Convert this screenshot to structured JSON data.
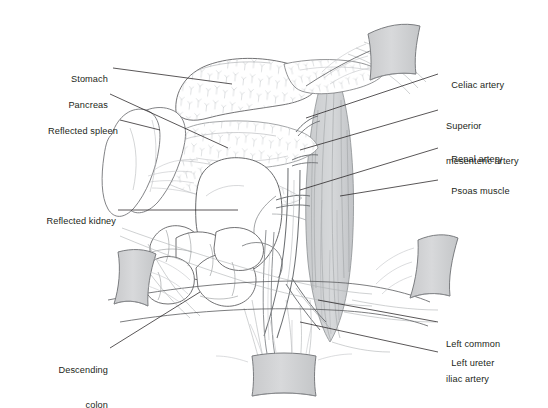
{
  "figure": {
    "background_color": "#ffffff",
    "ink_color": "#231f20",
    "line_color": "#4a4a4a",
    "pale_line_color": "#b9bdc0",
    "retractor_fill": "#d2d3d5",
    "retractor_stroke": "#6e7174",
    "muscle_fill": "#d0d2d4",
    "muscle_stroke": "#8a8d90"
  },
  "labels": {
    "left": [
      {
        "id": "stomach",
        "text": "Stomach",
        "lines": [
          "Stomach"
        ]
      },
      {
        "id": "pancreas",
        "text": "Pancreas",
        "lines": [
          "Pancreas"
        ]
      },
      {
        "id": "reflected-spleen",
        "text": "Reflected spleen",
        "lines": [
          "Reflected spleen"
        ]
      },
      {
        "id": "reflected-kidney",
        "text": "Reflected kidney",
        "lines": [
          "Reflected kidney"
        ]
      },
      {
        "id": "descending-colon",
        "text": "Descending colon",
        "lines": [
          "Descending",
          "colon"
        ]
      }
    ],
    "right": [
      {
        "id": "celiac-artery",
        "text": "Celiac artery",
        "lines": [
          "Celiac artery"
        ]
      },
      {
        "id": "superior-mesenteric-artery",
        "text": "Superior mesenteric artery",
        "lines": [
          "Superior",
          "mesenteric artery"
        ]
      },
      {
        "id": "renal-artery",
        "text": "Renal artery",
        "lines": [
          "Renal artery"
        ]
      },
      {
        "id": "psoas-muscle",
        "text": "Psoas muscle",
        "lines": [
          "Psoas muscle"
        ]
      },
      {
        "id": "left-common-iliac-artery",
        "text": "Left common iliac artery",
        "lines": [
          "Left common",
          "iliac artery"
        ]
      },
      {
        "id": "left-ureter",
        "text": "Left ureter",
        "lines": [
          "Left ureter"
        ]
      }
    ]
  },
  "structures": [
    {
      "id": "stomach",
      "name": "Stomach",
      "kind": "organ"
    },
    {
      "id": "pancreas",
      "name": "Pancreas",
      "kind": "organ"
    },
    {
      "id": "reflected-spleen",
      "name": "Reflected spleen",
      "kind": "organ"
    },
    {
      "id": "reflected-kidney",
      "name": "Reflected kidney",
      "kind": "organ"
    },
    {
      "id": "descending-colon",
      "name": "Descending colon",
      "kind": "organ"
    },
    {
      "id": "celiac-artery",
      "name": "Celiac artery",
      "kind": "vessel"
    },
    {
      "id": "superior-mesenteric-artery",
      "name": "Superior mesenteric artery",
      "kind": "vessel"
    },
    {
      "id": "renal-artery",
      "name": "Renal artery",
      "kind": "vessel"
    },
    {
      "id": "left-common-iliac-artery",
      "name": "Left common iliac artery",
      "kind": "vessel"
    },
    {
      "id": "left-ureter",
      "name": "Left ureter",
      "kind": "duct"
    },
    {
      "id": "psoas-muscle",
      "name": "Psoas muscle",
      "kind": "muscle"
    },
    {
      "id": "retractor-top",
      "name": "Retractor blade (superior)",
      "kind": "instrument"
    },
    {
      "id": "retractor-right",
      "name": "Retractor blade (lateral)",
      "kind": "instrument"
    },
    {
      "id": "retractor-bottom",
      "name": "Retractor blade (inferior)",
      "kind": "instrument"
    },
    {
      "id": "retractor-left",
      "name": "Retractor blade (medial)",
      "kind": "instrument"
    }
  ]
}
